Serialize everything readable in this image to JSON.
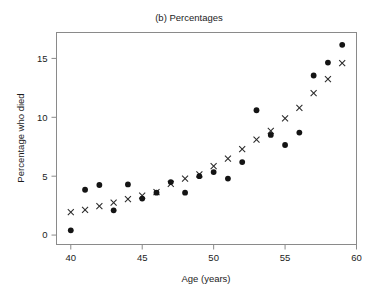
{
  "chart_data": {
    "type": "scatter",
    "title": "(b) Percentages",
    "xlabel": "Age (years)",
    "ylabel": "Percentage who died",
    "xlim": [
      39,
      60
    ],
    "ylim": [
      -0.8,
      17.2
    ],
    "xticks": [
      40,
      45,
      50,
      55,
      60
    ],
    "yticks": [
      0,
      5,
      10,
      15
    ],
    "xtick_labels": [
      "40",
      "45",
      "50",
      "55",
      "60"
    ],
    "ytick_labels": [
      "0",
      "5",
      "10",
      "15"
    ],
    "grid": false,
    "legend": "none",
    "x": [
      40,
      41,
      42,
      43,
      44,
      45,
      46,
      47,
      48,
      49,
      50,
      51,
      52,
      53,
      54,
      55,
      56,
      57,
      58,
      59
    ],
    "series": [
      {
        "name": "observed",
        "marker": "filled-circle",
        "color": "#141414",
        "values": [
          0.4,
          3.85,
          4.25,
          2.1,
          4.3,
          3.1,
          3.6,
          4.5,
          3.6,
          5.0,
          5.35,
          4.8,
          6.2,
          10.6,
          8.5,
          7.65,
          8.7,
          13.55,
          14.65,
          16.15
        ]
      },
      {
        "name": "expected",
        "marker": "cross",
        "color": "#2b2b2b",
        "values": [
          1.95,
          2.15,
          2.45,
          2.75,
          3.05,
          3.35,
          3.65,
          4.35,
          4.8,
          5.15,
          5.85,
          6.5,
          7.3,
          8.1,
          8.85,
          9.9,
          10.8,
          12.05,
          13.25,
          14.6
        ]
      }
    ]
  },
  "axes": {
    "tick_color": "#8a8a8a",
    "frame_color": "#8a8a8a"
  }
}
